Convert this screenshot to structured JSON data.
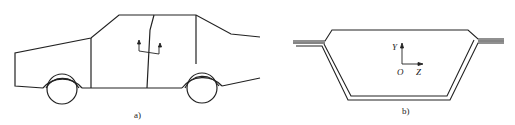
{
  "figure": {
    "panel_a": {
      "caption": "a)",
      "subject": "car side view",
      "symbol": "two upward arrows on bracket (door cross-section marker)"
    },
    "panel_b": {
      "caption": "b)",
      "subject": "door cross-section profile",
      "axes": {
        "y_label": "Y",
        "origin_label": "O",
        "z_label": "Z"
      }
    },
    "colors": {
      "line": "#222222",
      "background": "#ffffff"
    }
  }
}
